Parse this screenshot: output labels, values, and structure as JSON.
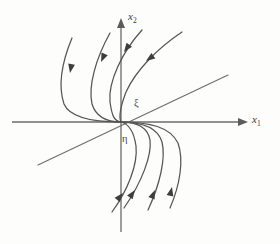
{
  "figure": {
    "type": "phase-portrait",
    "background_color": "#fdfdfc",
    "axis_color": "#6b6b6b",
    "trajectory_color": "#555555",
    "label_color": "#3a3a3a"
  },
  "axes": {
    "horizontal": {
      "label_main": "x",
      "label_sub": "1",
      "label_full": "x₁",
      "y_position": 122,
      "x_start": 12,
      "x_end": 248,
      "arrow_at": "right"
    },
    "vertical": {
      "label_main": "x",
      "label_sub": "2",
      "label_full": "x₂",
      "x_position": 121,
      "y_start": 18,
      "y_end": 232,
      "arrow_at": "top"
    },
    "origin": {
      "x": 121,
      "y": 122
    }
  },
  "labels": {
    "xi": "ξ",
    "eta": "η"
  },
  "chart_data": {
    "type": "line",
    "title": "",
    "xlabel": "x₁",
    "ylabel": "x₂",
    "grid": false,
    "legend": "none",
    "node_type": "improper node",
    "stability": "asymptotically stable",
    "eigendirection": {
      "name": "ξ",
      "line_points": [
        [
          38,
          165
        ],
        [
          228,
          75
        ]
      ],
      "slope_sign": "positive"
    },
    "generalized_direction": {
      "name": "η"
    },
    "series": [
      {
        "name": "trajectory-upper-left-1",
        "path": "M 72,38 C 62,62 58,86 64,104 C 70,118 92,122 121,122",
        "arrow": {
          "x": 70,
          "y": 73,
          "angle": 100
        }
      },
      {
        "name": "trajectory-upper-left-2",
        "path": "M 110,33 C 96,58 88,86 92,104 C 96,117 106,122 121,122",
        "arrow": {
          "x": 101,
          "y": 62,
          "angle": 114
        }
      },
      {
        "name": "trajectory-upper-left-3",
        "path": "M 142,30 C 122,52 108,82 110,102 C 112,116 114,121 121,122",
        "arrow": {
          "x": 124,
          "y": 52,
          "angle": 126
        }
      },
      {
        "name": "trajectory-upper-right-crossing",
        "path": "M 182,32 C 158,48 136,70 126,92 C 120,108 119,118 121,122",
        "arrow": {
          "x": 146,
          "y": 61,
          "angle": 145
        }
      },
      {
        "name": "trajectory-lower-right-1",
        "path": "M 121,122 C 150,122 170,127 178,143 C 184,160 180,185 170,208",
        "arrow": {
          "x": 172,
          "y": 187,
          "angle": 283
        }
      },
      {
        "name": "trajectory-lower-right-2",
        "path": "M 121,122 C 144,122 158,128 162,142 C 166,158 160,184 148,210",
        "arrow": {
          "x": 155,
          "y": 190,
          "angle": 293
        }
      },
      {
        "name": "trajectory-lower-right-3",
        "path": "M 121,122 C 139,122 148,128 150,140 C 152,155 142,182 124,208",
        "arrow": {
          "x": 135,
          "y": 190,
          "angle": 305
        }
      },
      {
        "name": "trajectory-lower-left-crossing",
        "path": "M 121,122 C 129,124 134,132 136,146 C 138,164 128,190 112,212",
        "arrow": {
          "x": 123,
          "y": 193,
          "angle": 310
        }
      }
    ]
  }
}
